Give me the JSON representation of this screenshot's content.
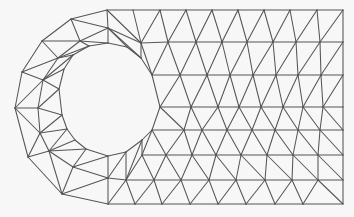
{
  "figure": {
    "title": "Triangular finite element mesh of plate with circular hole",
    "type": "2D triangular mesh",
    "colors": {
      "background": "#f7f7f7",
      "edge": "#555555"
    }
  },
  "mesh": {
    "nodes": {
      "R0": [
        [
          107,
          10
        ],
        [
          133,
          10
        ],
        [
          160,
          10
        ],
        [
          186,
          10
        ],
        [
          212,
          10
        ],
        [
          238,
          10
        ],
        [
          264,
          10
        ],
        [
          290,
          10
        ],
        [
          317,
          10
        ],
        [
          343,
          10
        ]
      ],
      "R1": [
        [
          141,
          43
        ],
        [
          168,
          42
        ],
        [
          196,
          42
        ],
        [
          222,
          42
        ],
        [
          247,
          42
        ],
        [
          273,
          42
        ],
        [
          296,
          42
        ],
        [
          320,
          42
        ],
        [
          343,
          42
        ]
      ],
      "R2": [
        [
          152,
          75
        ],
        [
          180,
          75
        ],
        [
          207,
          75
        ],
        [
          230,
          75
        ],
        [
          253,
          75
        ],
        [
          276,
          75
        ],
        [
          298,
          75
        ],
        [
          321,
          75
        ],
        [
          343,
          75
        ]
      ],
      "R3": [
        [
          160,
          107
        ],
        [
          191,
          107
        ],
        [
          218,
          107
        ],
        [
          239,
          107
        ],
        [
          261,
          107
        ],
        [
          283,
          107
        ],
        [
          303,
          107
        ],
        [
          323,
          107
        ],
        [
          343,
          107
        ]
      ],
      "R4": [
        [
          152,
          130
        ],
        [
          184,
          130
        ],
        [
          202,
          130
        ],
        [
          227,
          130
        ],
        [
          252,
          130
        ],
        [
          275,
          130
        ],
        [
          298,
          130
        ],
        [
          320,
          130
        ],
        [
          343,
          130
        ]
      ],
      "R5": [
        [
          142,
          155
        ],
        [
          166,
          155
        ],
        [
          192,
          155
        ],
        [
          216,
          155
        ],
        [
          241,
          155
        ],
        [
          267,
          155
        ],
        [
          293,
          155
        ],
        [
          318,
          155
        ],
        [
          343,
          155
        ]
      ],
      "R6": [
        [
          126,
          180
        ],
        [
          154,
          180
        ],
        [
          181,
          180
        ],
        [
          209,
          180
        ],
        [
          236,
          180
        ],
        [
          265,
          180
        ],
        [
          292,
          180
        ],
        [
          318,
          180
        ],
        [
          343,
          180
        ]
      ],
      "R7": [
        [
          108,
          204
        ],
        [
          135,
          204
        ],
        [
          162,
          204
        ],
        [
          190,
          204
        ],
        [
          218,
          204
        ],
        [
          246,
          204
        ],
        [
          275,
          204
        ],
        [
          303,
          204
        ],
        [
          343,
          204
        ]
      ],
      "hole": [
        [
          160,
          107
        ],
        [
          152,
          75
        ],
        [
          141,
          58
        ],
        [
          127,
          47
        ],
        [
          108,
          43
        ],
        [
          89,
          46
        ],
        [
          73,
          55
        ],
        [
          64,
          69
        ],
        [
          59,
          89
        ],
        [
          62,
          115
        ],
        [
          67,
          129
        ],
        [
          75,
          140
        ],
        [
          86,
          149
        ],
        [
          108,
          156
        ],
        [
          126,
          152
        ],
        [
          142,
          140
        ],
        [
          152,
          130
        ]
      ],
      "ring_mid": [
        [
          141,
          43
        ],
        [
          108,
          28
        ],
        [
          80,
          41
        ],
        [
          58,
          58
        ],
        [
          43,
          80
        ],
        [
          38,
          108
        ],
        [
          40,
          133
        ],
        [
          49,
          151
        ],
        [
          73,
          167
        ],
        [
          108,
          178
        ],
        [
          126,
          180
        ]
      ],
      "outer": [
        [
          107,
          10
        ],
        [
          71,
          19
        ],
        [
          42,
          41
        ],
        [
          22,
          72
        ],
        [
          15,
          108
        ],
        [
          28,
          157
        ],
        [
          62,
          194
        ],
        [
          108,
          204
        ]
      ]
    },
    "element_count_estimate": 260,
    "node_count_estimate": 140
  }
}
